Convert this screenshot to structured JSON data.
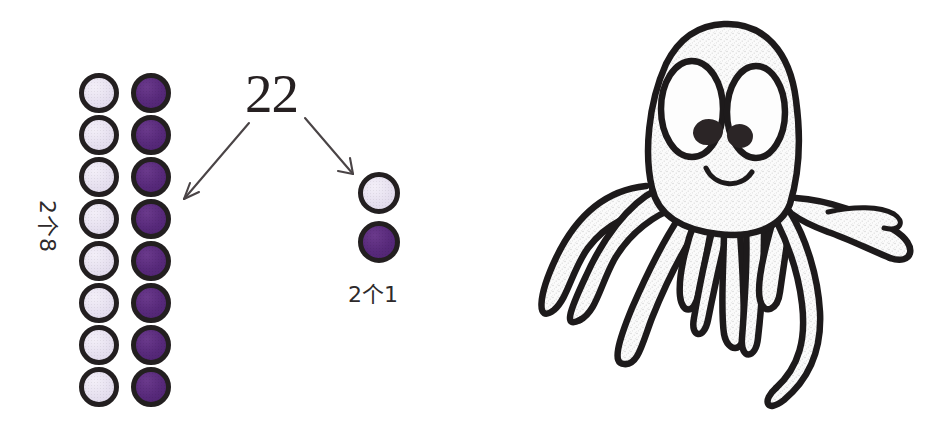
{
  "worksheet": {
    "total_number": "22",
    "tens_group": {
      "label": "2个8",
      "light_count": 8,
      "dark_count": 8,
      "column_count": 2
    },
    "ones_group": {
      "label": "2个1",
      "light_count": 1,
      "dark_count": 1
    },
    "arrows": [
      {
        "name": "arrow-to-tens",
        "direction": "down-left"
      },
      {
        "name": "arrow-to-ones",
        "direction": "down-right"
      }
    ]
  },
  "illustration": {
    "subject": "octopus",
    "style": "hand-drawn pencil sketch",
    "tentacle_count": 8,
    "eye_count": 2,
    "has_smile": true
  },
  "colors": {
    "bead_light": "#e6e0ef",
    "bead_dark": "#57297a",
    "outline": "#231f20",
    "ink": "#1d1a1b",
    "background": "#ffffff"
  }
}
